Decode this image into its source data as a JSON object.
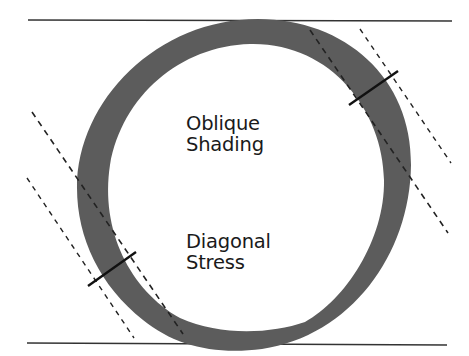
{
  "diagram": {
    "labels": {
      "top": [
        "Oblique",
        "Shading"
      ],
      "bottom": [
        "Diagonal",
        "Stress"
      ]
    },
    "colors": {
      "ring": "#5c5c5c",
      "lines": "#222222",
      "background": "#ffffff",
      "text": "#1a1a1a"
    },
    "elements": [
      "top-baseline",
      "bottom-baseline",
      "stroke-ring",
      "right-stress-axis-pair",
      "left-stress-axis-pair",
      "right-thickness-tick",
      "left-thickness-tick"
    ]
  }
}
